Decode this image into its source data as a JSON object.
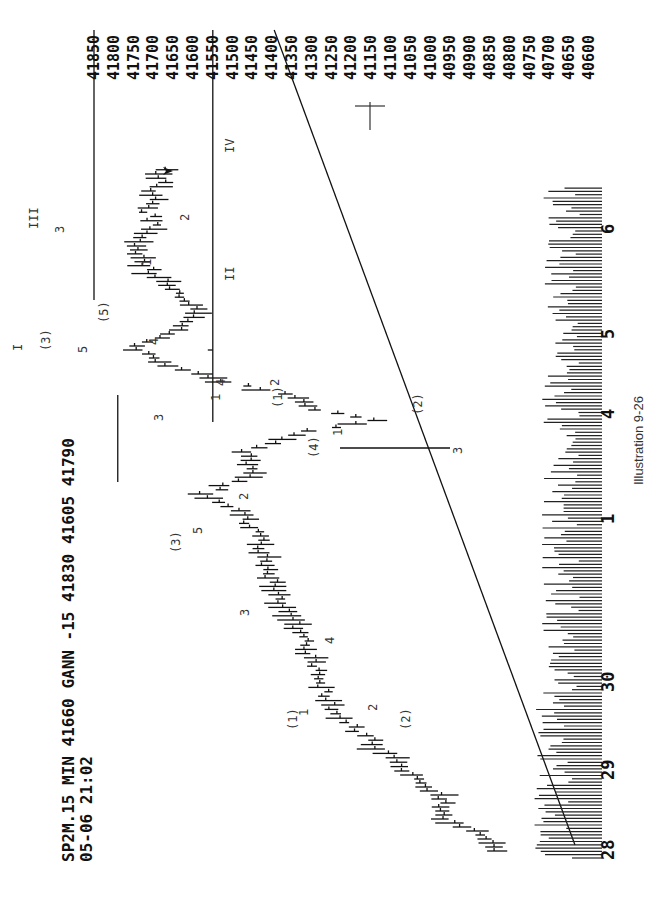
{
  "header": {
    "line1": "SP2M.15 MIN 41660 GANN  -15 41830 41605 41790",
    "line2": "05-06 21:02",
    "symbol": "SP2M.15 MIN",
    "last": "41660",
    "study": "GANN",
    "change": "-15",
    "high": "41830",
    "low": "41605",
    "marked_high": "41790"
  },
  "caption": "Illustration 9-26",
  "chart_data": {
    "type": "bar",
    "subtype": "OHLC price bars (15-minute) with volume histogram, rotated 90° counter-clockwise",
    "title": "SP2M.15 MIN 41660 GANN -15 41830 41605 41790",
    "subtitle": "05-06 21:02",
    "xlabel": "Date",
    "ylabel": "Price",
    "ylim": [
      40600,
      41850
    ],
    "y_ticks": [
      41850,
      41800,
      41750,
      41700,
      41650,
      41600,
      41550,
      41500,
      41450,
      41400,
      41350,
      41300,
      41250,
      41200,
      41150,
      41100,
      41050,
      41000,
      40950,
      40900,
      40850,
      40800,
      40750,
      40700,
      40650,
      40600
    ],
    "x_ticks": [
      "28",
      "29",
      "30",
      "1",
      "4",
      "5",
      "6"
    ],
    "grid": false,
    "legend": null,
    "reference_lines": [
      {
        "type": "horizontal",
        "price": 41850,
        "label": "41850",
        "from": "6",
        "note": "III top resistance"
      },
      {
        "type": "horizontal",
        "price": 41790,
        "label": "41790",
        "note": "wave I / (3) high"
      },
      {
        "type": "horizontal",
        "price": 41550,
        "label": "41550",
        "note": "wave II / IV support"
      },
      {
        "type": "trendline",
        "from_price": 40960,
        "from_date": "28",
        "to_price": 41400,
        "note": "rising trendline"
      },
      {
        "type": "marker",
        "price": 40950,
        "label": "cross",
        "note": "cross marker at 40950"
      }
    ],
    "wave_labels": [
      {
        "text": "(1)",
        "date_approx": "29.6",
        "price_approx": 41320
      },
      {
        "text": "1",
        "date_approx": "29.7",
        "price_approx": 41290
      },
      {
        "text": "2",
        "date_approx": "29.8",
        "price_approx": 41180
      },
      {
        "text": "(2)",
        "date_approx": "29.7",
        "price_approx": 41140
      },
      {
        "text": "3",
        "date_approx": "30.5",
        "price_approx": 41480
      },
      {
        "text": "4",
        "date_approx": "30.9",
        "price_approx": 41360
      },
      {
        "text": "(3)",
        "date_approx": "1.1",
        "price_approx": 41610
      },
      {
        "text": "5",
        "date_approx": "1.2",
        "price_approx": 41540
      },
      {
        "text": "(4)",
        "date_approx": "1.6",
        "price_approx": 41300
      },
      {
        "text": "1",
        "date_approx": "1.7",
        "price_approx": 41230
      },
      {
        "text": "2",
        "date_approx": "1.8",
        "price_approx": 41450
      },
      {
        "text": "3",
        "date_approx": "1.8",
        "price_approx": 41080
      },
      {
        "text": "(1)",
        "date_approx": "4.1",
        "price_approx": 41290
      },
      {
        "text": "2",
        "date_approx": "4.2",
        "price_approx": 41270
      },
      {
        "text": "(2)",
        "date_approx": "4.1",
        "price_approx": 41140
      },
      {
        "text": "3",
        "date_approx": "4.2",
        "price_approx": 41480
      },
      {
        "text": "1",
        "date_approx": "4.2",
        "price_approx": 41450
      },
      {
        "text": "4",
        "date_approx": "4.3",
        "price_approx": 41420
      },
      {
        "text": "I",
        "date_approx": "4.8",
        "price_approx": 41860
      },
      {
        "text": "(3)",
        "date_approx": "4.8",
        "price_approx": 41820
      },
      {
        "text": "5",
        "date_approx": "4.7",
        "price_approx": 41760
      },
      {
        "text": "4",
        "date_approx": "4.8",
        "price_approx": 41700
      },
      {
        "text": "(5)",
        "date_approx": "4.9",
        "price_approx": 41760
      },
      {
        "text": "1",
        "date_approx": "5.4",
        "price_approx": 41740
      },
      {
        "text": "2",
        "date_approx": "5.5",
        "price_approx": 41640
      },
      {
        "text": "II",
        "date_approx": "5.1",
        "price_approx": 41530
      },
      {
        "text": "3",
        "date_approx": "5.9",
        "price_approx": 41800
      },
      {
        "text": "III",
        "date_approx": "6.0",
        "price_approx": 41840
      },
      {
        "text": "IV",
        "date_approx": "6.6",
        "price_approx": 41530
      }
    ],
    "price_path": {
      "description": "Approximate closing-price path of the 15-min bars, oldest to newest",
      "dates": [
        "28.0",
        "28.2",
        "28.4",
        "28.6",
        "29.0",
        "29.3",
        "29.6",
        "29.8",
        "30.0",
        "30.3",
        "30.6",
        "30.9",
        "1.0",
        "1.2",
        "1.4",
        "1.6",
        "1.8",
        "1.9",
        "4.0",
        "4.2",
        "4.4",
        "4.6",
        "4.8",
        "5.0",
        "5.2",
        "5.5",
        "5.8",
        "6.0",
        "6.2",
        "6.5",
        "6.7"
      ],
      "values": [
        40840,
        40870,
        40980,
        40960,
        41060,
        41140,
        41230,
        41260,
        41280,
        41330,
        41400,
        41440,
        41480,
        41570,
        41440,
        41470,
        41300,
        41140,
        41290,
        41380,
        41560,
        41690,
        41760,
        41630,
        41590,
        41690,
        41760,
        41700,
        41720,
        41680,
        41680
      ]
    },
    "last_marker": {
      "symbol": "arrow",
      "price_approx": 41670,
      "date": "6.7"
    },
    "volume": {
      "description": "Volume histogram along the date axis, relative heights only",
      "relative_range": [
        0.15,
        1.0
      ]
    }
  }
}
